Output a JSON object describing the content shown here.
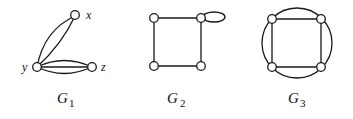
{
  "graphs": [
    {
      "name": "G",
      "subscript": "1",
      "vertices": [
        {
          "id": "x",
          "label": "x"
        },
        {
          "id": "y",
          "label": "y"
        },
        {
          "id": "z",
          "label": "z"
        }
      ],
      "edges": [
        {
          "from": "y",
          "to": "x",
          "multiplicity": 2
        },
        {
          "from": "y",
          "to": "z",
          "multiplicity": 3
        }
      ]
    },
    {
      "name": "G",
      "subscript": "2",
      "vertices": [
        {
          "id": "a",
          "label": ""
        },
        {
          "id": "b",
          "label": ""
        },
        {
          "id": "c",
          "label": ""
        },
        {
          "id": "d",
          "label": ""
        }
      ],
      "edges": [
        {
          "from": "a",
          "to": "b",
          "multiplicity": 1
        },
        {
          "from": "b",
          "to": "d",
          "multiplicity": 1
        },
        {
          "from": "d",
          "to": "c",
          "multiplicity": 1
        },
        {
          "from": "c",
          "to": "a",
          "multiplicity": 1
        },
        {
          "from": "b",
          "to": "b",
          "multiplicity": 1,
          "type": "loop"
        }
      ]
    },
    {
      "name": "G",
      "subscript": "3",
      "vertices": [
        {
          "id": "a",
          "label": ""
        },
        {
          "id": "b",
          "label": ""
        },
        {
          "id": "c",
          "label": ""
        },
        {
          "id": "d",
          "label": ""
        }
      ],
      "edges": [
        {
          "from": "a",
          "to": "b",
          "multiplicity": 2
        },
        {
          "from": "b",
          "to": "d",
          "multiplicity": 2
        },
        {
          "from": "d",
          "to": "c",
          "multiplicity": 2
        },
        {
          "from": "c",
          "to": "a",
          "multiplicity": 2
        }
      ]
    }
  ]
}
